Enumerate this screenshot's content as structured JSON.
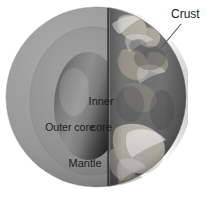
{
  "figure": {
    "background_color": "#ffffff"
  },
  "labels": {
    "crust": "Crust",
    "inner_core_line1": "Inner",
    "inner_core_line2": "core",
    "outer_core": "Outer core",
    "mantle": "Mantle"
  },
  "colors": {
    "mantle": "#9a9a9a",
    "outer_core": "#8e8e8e",
    "inner_core_light": "#8b8b8b",
    "inner_core_dark": "#1d1d1d",
    "surface_ocean": "#6f6f6f",
    "surface_land": "#b9b5a8",
    "surface_cloud": "#ececec",
    "cut_plane_line": "#3a3a3a",
    "text": "#1b1b1b",
    "leader_line": "#555555"
  },
  "geometry": {
    "globe_center_x": 96,
    "globe_center_y": 97,
    "globe_radius": 90,
    "cut_plane_x": 108,
    "inner_core_center_x": 88,
    "inner_core_center_y": 106,
    "inner_core_radius_x": 34,
    "inner_core_radius_y": 54
  },
  "leader": {
    "from_x": 181,
    "from_y": 24,
    "to_x": 161,
    "to_y": 48
  }
}
